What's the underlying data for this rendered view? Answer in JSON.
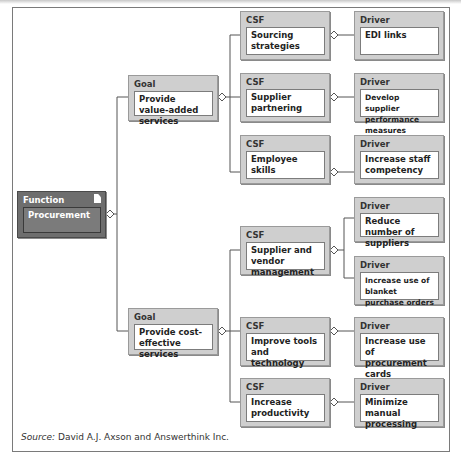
{
  "figure": {
    "source_label": "Source:",
    "source_text": " David A.J. Axson and Answerthink Inc."
  },
  "function": {
    "header": "Function",
    "label": "Procurement",
    "icon": "document-icon"
  },
  "goals": [
    {
      "header": "Goal",
      "label": "Provide value-added services"
    },
    {
      "header": "Goal",
      "label": "Provide cost-effective services"
    }
  ],
  "csfs": [
    {
      "header": "CSF",
      "label": "Sourcing strategies"
    },
    {
      "header": "CSF",
      "label": "Supplier partnering"
    },
    {
      "header": "CSF",
      "label": "Employee skills"
    },
    {
      "header": "CSF",
      "label": "Supplier and vendor management"
    },
    {
      "header": "CSF",
      "label": "Improve tools and technology"
    },
    {
      "header": "CSF",
      "label": "Increase productivity"
    }
  ],
  "drivers": [
    {
      "header": "Driver",
      "label": "EDI links"
    },
    {
      "header": "Driver",
      "label": "Develop supplier performance measures"
    },
    {
      "header": "Driver",
      "label": "Increase staff competency"
    },
    {
      "header": "Driver",
      "label": "Reduce number of suppliers"
    },
    {
      "header": "Driver",
      "label": "Increase use of blanket purchase orders"
    },
    {
      "header": "Driver",
      "label": "Increase use of procurement cards"
    },
    {
      "header": "Driver",
      "label": "Minimize manual processing"
    }
  ],
  "colors": {
    "box_fill": "#cfcfcf",
    "function_fill": "#6e6e6e",
    "line": "#555555"
  }
}
